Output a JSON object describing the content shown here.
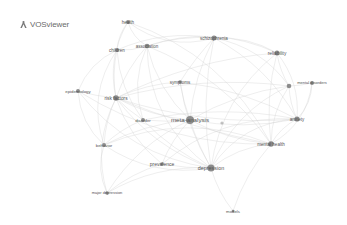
{
  "app": {
    "name": "VOSviewer"
  },
  "colors": {
    "node": "#7a7a7a",
    "edge": "#d4d4d4",
    "label": "#555555",
    "background": "#ffffff"
  },
  "nodes": [
    {
      "id": "health",
      "label": "health",
      "x": 128,
      "y": 22,
      "r": 2.0,
      "fs": 4.5
    },
    {
      "id": "children",
      "label": "children",
      "x": 117,
      "y": 50,
      "r": 2.0,
      "fs": 4.5
    },
    {
      "id": "association",
      "label": "association",
      "x": 147,
      "y": 46,
      "r": 2.3,
      "fs": 4.5
    },
    {
      "id": "schizophrenia",
      "label": "schizophrenia",
      "x": 214,
      "y": 38,
      "r": 2.5,
      "fs": 4.5
    },
    {
      "id": "reliability",
      "label": "reliability",
      "x": 277,
      "y": 53,
      "r": 2.5,
      "fs": 4.8
    },
    {
      "id": "mental-disorders-hub",
      "label": "",
      "x": 289,
      "y": 86,
      "r": 2.3,
      "fs": 4.5
    },
    {
      "id": "mental-disorders",
      "label": "mental disorders",
      "x": 312,
      "y": 83,
      "r": 2.0,
      "fs": 4.0
    },
    {
      "id": "symptoms",
      "label": "symptoms",
      "x": 180,
      "y": 82,
      "r": 1.8,
      "fs": 4.5
    },
    {
      "id": "epidemiology",
      "label": "epidemiology",
      "x": 78,
      "y": 91,
      "r": 2.0,
      "fs": 4.3
    },
    {
      "id": "risk-factors",
      "label": "risk factors",
      "x": 116,
      "y": 98,
      "r": 2.8,
      "fs": 4.8
    },
    {
      "id": "disorder",
      "label": "disorder",
      "x": 143,
      "y": 120,
      "r": 2.0,
      "fs": 4.3
    },
    {
      "id": "meta-analysis",
      "label": "meta-analysis",
      "x": 190,
      "y": 120,
      "r": 4.0,
      "fs": 6.2
    },
    {
      "id": "minor-node",
      "label": "",
      "x": 222,
      "y": 123,
      "r": 1.6,
      "fs": 4
    },
    {
      "id": "anxiety",
      "label": "anxiety",
      "x": 297,
      "y": 119,
      "r": 2.6,
      "fs": 4.6
    },
    {
      "id": "mental-health",
      "label": "mental health",
      "x": 271,
      "y": 144,
      "r": 2.8,
      "fs": 4.6
    },
    {
      "id": "behavior",
      "label": "behavior",
      "x": 104,
      "y": 145,
      "r": 2.0,
      "fs": 4.3
    },
    {
      "id": "prevalence",
      "label": "prevalence",
      "x": 162,
      "y": 164,
      "r": 1.8,
      "fs": 5.0
    },
    {
      "id": "depression",
      "label": "depression",
      "x": 211,
      "y": 168,
      "r": 3.6,
      "fs": 5.4
    },
    {
      "id": "major-depression",
      "label": "major depression",
      "x": 107,
      "y": 193,
      "r": 1.8,
      "fs": 4.0
    },
    {
      "id": "models",
      "label": "models",
      "x": 233,
      "y": 211,
      "r": 1.3,
      "fs": 4.3
    }
  ],
  "edges": [
    [
      "health",
      "children",
      0.15
    ],
    [
      "health",
      "association",
      0.2
    ],
    [
      "health",
      "schizophrenia",
      0.25
    ],
    [
      "health",
      "risk-factors",
      0.2
    ],
    [
      "health",
      "mental-health",
      -0.2
    ],
    [
      "children",
      "association",
      0.1
    ],
    [
      "children",
      "risk-factors",
      0.1
    ],
    [
      "children",
      "epidemiology",
      0.2
    ],
    [
      "children",
      "disorder",
      0.15
    ],
    [
      "children",
      "behavior",
      0.25
    ],
    [
      "children",
      "schizophrenia",
      -0.15
    ],
    [
      "association",
      "schizophrenia",
      -0.1
    ],
    [
      "association",
      "depression",
      0.25
    ],
    [
      "association",
      "meta-analysis",
      0.15
    ],
    [
      "association",
      "risk-factors",
      0.1
    ],
    [
      "association",
      "disorder",
      0.2
    ],
    [
      "association",
      "reliability",
      -0.2
    ],
    [
      "association",
      "mental-health",
      -0.15
    ],
    [
      "schizophrenia",
      "reliability",
      -0.15
    ],
    [
      "schizophrenia",
      "mental-disorders-hub",
      -0.2
    ],
    [
      "schizophrenia",
      "meta-analysis",
      0.1
    ],
    [
      "schizophrenia",
      "depression",
      0.1
    ],
    [
      "schizophrenia",
      "symptoms",
      0.05
    ],
    [
      "schizophrenia",
      "anxiety",
      -0.15
    ],
    [
      "reliability",
      "mental-disorders-hub",
      0.1
    ],
    [
      "reliability",
      "anxiety",
      -0.2
    ],
    [
      "reliability",
      "depression",
      0.2
    ],
    [
      "reliability",
      "mental-health",
      0.1
    ],
    [
      "reliability",
      "risk-factors",
      0.1
    ],
    [
      "mental-disorders-hub",
      "mental-disorders",
      0.05
    ],
    [
      "mental-disorders-hub",
      "anxiety",
      0.1
    ],
    [
      "mental-disorders-hub",
      "mental-health",
      0.15
    ],
    [
      "mental-disorders-hub",
      "depression",
      0.2
    ],
    [
      "mental-disorders-hub",
      "meta-analysis",
      0.1
    ],
    [
      "mental-disorders-hub",
      "risk-factors",
      0.1
    ],
    [
      "mental-disorders",
      "anxiety",
      -0.2
    ],
    [
      "mental-disorders",
      "mental-health",
      -0.25
    ],
    [
      "symptoms",
      "depression",
      0.1
    ],
    [
      "symptoms",
      "meta-analysis",
      0.05
    ],
    [
      "symptoms",
      "risk-factors",
      0.1
    ],
    [
      "symptoms",
      "anxiety",
      -0.1
    ],
    [
      "epidemiology",
      "risk-factors",
      0.05
    ],
    [
      "epidemiology",
      "behavior",
      0.2
    ],
    [
      "epidemiology",
      "depression",
      0.2
    ],
    [
      "epidemiology",
      "mental-health",
      0.15
    ],
    [
      "risk-factors",
      "disorder",
      0.05
    ],
    [
      "risk-factors",
      "meta-analysis",
      0.1
    ],
    [
      "risk-factors",
      "depression",
      0.15
    ],
    [
      "risk-factors",
      "behavior",
      0.1
    ],
    [
      "risk-factors",
      "mental-health",
      0.05
    ],
    [
      "risk-factors",
      "anxiety",
      0.1
    ],
    [
      "risk-factors",
      "prevalence",
      0.15
    ],
    [
      "risk-factors",
      "major-depression",
      0.2
    ],
    [
      "disorder",
      "meta-analysis",
      0.05
    ],
    [
      "disorder",
      "depression",
      0.1
    ],
    [
      "disorder",
      "anxiety",
      -0.1
    ],
    [
      "disorder",
      "behavior",
      0.1
    ],
    [
      "meta-analysis",
      "depression",
      0.05
    ],
    [
      "meta-analysis",
      "anxiety",
      0.1
    ],
    [
      "meta-analysis",
      "mental-health",
      0.1
    ],
    [
      "meta-analysis",
      "prevalence",
      0.1
    ],
    [
      "meta-analysis",
      "behavior",
      0.1
    ],
    [
      "meta-analysis",
      "major-depression",
      0.15
    ],
    [
      "anxiety",
      "depression",
      0.25
    ],
    [
      "anxiety",
      "mental-health",
      0.15
    ],
    [
      "anxiety",
      "prevalence",
      0.2
    ],
    [
      "mental-health",
      "depression",
      0.15
    ],
    [
      "mental-health",
      "models",
      0.1
    ],
    [
      "mental-health",
      "behavior",
      0.2
    ],
    [
      "behavior",
      "major-depression",
      0.2
    ],
    [
      "behavior",
      "depression",
      0.2
    ],
    [
      "prevalence",
      "depression",
      0.05
    ],
    [
      "prevalence",
      "major-depression",
      0.1
    ],
    [
      "depression",
      "major-depression",
      0.15
    ],
    [
      "depression",
      "models",
      0.1
    ]
  ]
}
